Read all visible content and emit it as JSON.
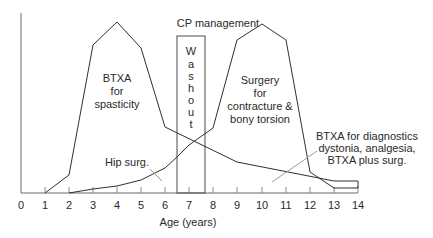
{
  "title": "CP management",
  "washout_letters": [
    "W",
    "a",
    "s",
    "h",
    "o",
    "u",
    "t"
  ],
  "x_axis": {
    "label": "Age (years)",
    "ticks": [
      "0",
      "1",
      "2",
      "3",
      "4",
      "5",
      "6",
      "7",
      "8",
      "9",
      "10",
      "11",
      "12",
      "13",
      "14"
    ]
  },
  "regions": {
    "btxa_spasticity": [
      "BTXA",
      "for",
      "spasticity"
    ],
    "surgery": [
      "Surgery",
      "for",
      "contracture &",
      "bony torsion"
    ],
    "hip_surgery": "Hip surg.",
    "btxa_diagnostics": [
      "BTXA for diagnostics",
      "dystonia, analgesia,",
      "BTXA plus surg."
    ]
  },
  "colors": {
    "line": "#2f2f2f",
    "axis": "#6a6a6a",
    "pointer": "#9a9a9a"
  }
}
